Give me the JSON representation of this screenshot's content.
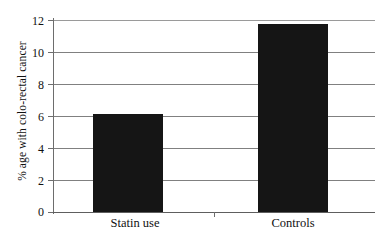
{
  "chart_data": {
    "type": "bar",
    "title": "",
    "categories": [
      "Statin use",
      "Controls"
    ],
    "values": [
      6.1,
      11.75
    ],
    "xlabel": "",
    "ylabel": "% age with colo-rectal cancer",
    "ylim": [
      0,
      12
    ],
    "yticks": [
      "0",
      "2",
      "4",
      "6",
      "8",
      "10",
      "12"
    ],
    "ytick_values": [
      0,
      2,
      4,
      6,
      8,
      10,
      12
    ],
    "grid": true,
    "legend": false,
    "bar_color": "#151515",
    "background_color": "#ffffff",
    "gridline_color": "#808080",
    "axis_color": "#6d6d6d"
  },
  "axes": {
    "y_title": "% age with colo-rectal cancer",
    "tick_0": "0",
    "tick_2": "2",
    "tick_4": "4",
    "tick_6": "6",
    "tick_8": "8",
    "tick_10": "10",
    "tick_12": "12"
  },
  "categories": {
    "statin": "Statin use",
    "controls": "Controls"
  }
}
